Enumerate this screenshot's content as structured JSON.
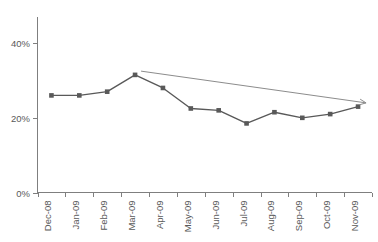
{
  "chart_data": {
    "type": "line",
    "title": "",
    "subtitle": "",
    "xlabel": "",
    "ylabel": "",
    "categories": [
      "Dec-08",
      "Jan-09",
      "Feb-09",
      "Mar-09",
      "Apr-09",
      "May-09",
      "Jun-09",
      "Jul-09",
      "Aug-09",
      "Sep-09",
      "Oct-09",
      "Nov-09"
    ],
    "values": [
      26,
      26,
      27,
      31.5,
      28,
      22.5,
      22,
      18.5,
      21.5,
      20,
      21,
      23
    ],
    "series": [
      {
        "name": "",
        "values": [
          26,
          26,
          27,
          31.5,
          28,
          22.5,
          22,
          18.5,
          21.5,
          20,
          21,
          23
        ],
        "color": "#595959",
        "marker": "square"
      }
    ],
    "ylim": [
      0,
      47
    ],
    "ytick_values": [
      0,
      20,
      40
    ],
    "ytick_labels": [
      "0%",
      "20%",
      "40%"
    ],
    "xtick_labels": [
      "Dec-08",
      "Jan-09",
      "Feb-09",
      "Mar-09",
      "Apr-09",
      "May-09",
      "Jun-09",
      "Jul-09",
      "Aug-09",
      "Sep-09",
      "Oct-09",
      "Nov-09"
    ],
    "xtick_rotation": 90,
    "grid": false,
    "legend": false,
    "legend_position": "none",
    "annotations": [
      {
        "type": "arrow",
        "name": "declining-trend-arrow",
        "label": "",
        "direction": "down-right",
        "from_category": "Mar-09",
        "to_category": "Nov-09",
        "from_value": 32.5,
        "to_value": 24,
        "color": "#8c8c8c"
      }
    ],
    "colors": {
      "series": "#595959",
      "axis": "#7f7f7f",
      "text": "#595959",
      "trend_arrow": "#8c8c8c",
      "background": "#ffffff"
    }
  }
}
